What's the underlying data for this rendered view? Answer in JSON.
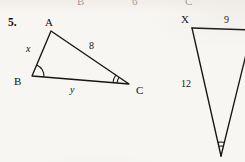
{
  "page": {
    "background_color": "#f8f6f3",
    "ink_color": "#1a1a1a"
  },
  "cut_off_row": {
    "note_visible_fragments": [
      "B",
      "6",
      "C"
    ],
    "items": [
      {
        "text": "B",
        "x": 77,
        "y": -4
      },
      {
        "text": "6",
        "x": 132,
        "y": -4
      },
      {
        "text": "C",
        "x": 185,
        "y": -4
      }
    ]
  },
  "problem": {
    "number": "5.",
    "number_x": 8,
    "number_y": 17
  },
  "figure_left": {
    "name": "triangle-abc",
    "vertices": {
      "A": {
        "x": 51,
        "y": 31
      },
      "B": {
        "x": 32,
        "y": 76
      },
      "C": {
        "x": 129,
        "y": 84
      }
    },
    "vertex_labels": [
      {
        "text": "A",
        "x": 45,
        "y": 17
      },
      {
        "text": "B",
        "x": 14,
        "y": 76
      },
      {
        "text": "C",
        "x": 136,
        "y": 85
      }
    ],
    "side_labels": [
      {
        "text": "x",
        "kind": "variable",
        "x": 26,
        "y": 44
      },
      {
        "text": "8",
        "kind": "measure",
        "x": 89,
        "y": 41
      },
      {
        "text": "y",
        "kind": "variable",
        "x": 70,
        "y": 85
      }
    ],
    "angle_marks": [
      {
        "at": "B",
        "arcs": 1
      },
      {
        "at": "C",
        "arcs": 2
      }
    ]
  },
  "figure_right": {
    "name": "triangle-xyz-partial",
    "vertices": {
      "X": {
        "x": 192,
        "y": 28
      },
      "top_right_offpage": {
        "x": 252,
        "y": 30
      },
      "apex": {
        "x": 221,
        "y": 156
      }
    },
    "vertex_labels": [
      {
        "text": "X",
        "x": 181,
        "y": 14
      }
    ],
    "side_labels": [
      {
        "text": "9",
        "kind": "measure",
        "x": 224,
        "y": 15
      },
      {
        "text": "12",
        "kind": "measure",
        "x": 181,
        "y": 79
      }
    ],
    "angle_marks": [
      {
        "at": "apex",
        "arcs": 2
      }
    ]
  }
}
